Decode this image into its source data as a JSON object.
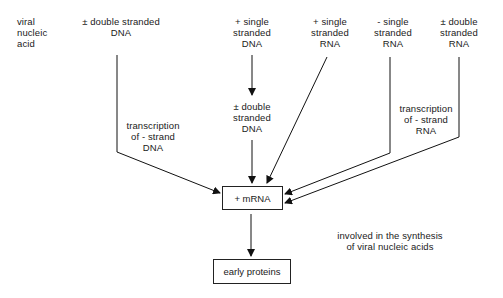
{
  "diagram": {
    "row_label": "viral\nnucleic\nacid",
    "sources": [
      {
        "id": "ds_dna",
        "label": "± double stranded\nDNA"
      },
      {
        "id": "ss_plus_dna",
        "label": "+ single\nstranded\nDNA"
      },
      {
        "id": "ss_plus_rna",
        "label": "+ single\nstranded\nRNA"
      },
      {
        "id": "ss_minus_rna",
        "label": "- single\nstranded\nRNA"
      },
      {
        "id": "ds_rna",
        "label": "± double\nstranded\nRNA"
      }
    ],
    "intermediate": {
      "label": "± double\nstranded\nDNA"
    },
    "annotations": {
      "transcription_dna": "transcription\nof - strand\nDNA",
      "transcription_rna": "transcription\nof - strand\nRNA",
      "synthesis_note": "involved in the synthesis\nof viral nucleic acids"
    },
    "nodes": {
      "mrna": "+ mRNA",
      "early_proteins": "early proteins"
    },
    "edges": [
      {
        "from": "ds_dna",
        "to": "mrna",
        "label": "transcription of - strand DNA"
      },
      {
        "from": "ss_plus_dna",
        "to": "intermediate"
      },
      {
        "from": "intermediate",
        "to": "mrna"
      },
      {
        "from": "ss_plus_rna",
        "to": "mrna"
      },
      {
        "from": "ss_minus_rna",
        "to": "mrna",
        "label": "transcription of - strand RNA"
      },
      {
        "from": "ds_rna",
        "to": "mrna",
        "label": "transcription of - strand RNA"
      },
      {
        "from": "mrna",
        "to": "early_proteins"
      }
    ]
  }
}
